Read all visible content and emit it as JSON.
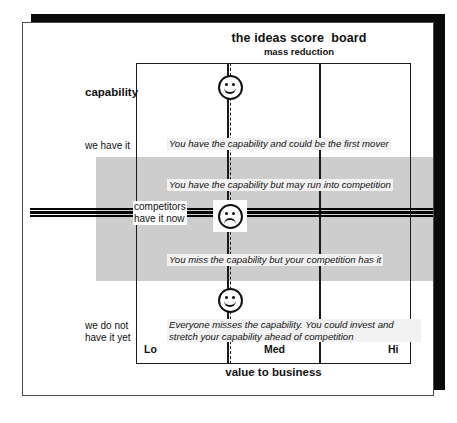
{
  "header": {
    "title": "the ideas score  board",
    "subtitle": "mass reduction"
  },
  "axes": {
    "y_title": "capability",
    "y_labels": {
      "top": "we have it",
      "middle": "competitors\nhave it now",
      "bottom": "we do not\nhave it yet"
    },
    "x_title": "value to business",
    "x_ticks": [
      "Lo",
      "Med",
      "Hi"
    ]
  },
  "quadrant_notes": [
    "You have the capability and could be the first mover",
    "You have the capability but may run into competition",
    "You miss the capability but your competition has it",
    "Everyone misses the capability. You could invest and stretch your capability ahead of competition"
  ],
  "icons": {
    "top_face": "smiley-happy-icon",
    "middle_face": "smiley-sad-icon",
    "bottom_face": "smiley-happy-icon"
  },
  "colors": {
    "band_gray": "#cdcdcd",
    "line_black": "#050505",
    "page_white": "#ffffff",
    "shadow_black": "#0a0a0a",
    "note_background": "#f2f2f2"
  }
}
